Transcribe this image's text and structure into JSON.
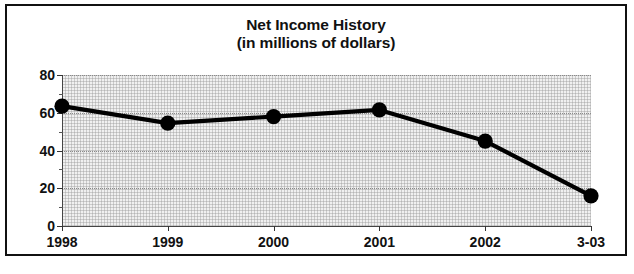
{
  "chart_data": {
    "type": "line",
    "title": "Net Income History",
    "subtitle": "(in millions of dollars)",
    "xlabel": "",
    "ylabel": "",
    "categories": [
      "1998",
      "1999",
      "2000",
      "2001",
      "2002",
      "3-03"
    ],
    "values": [
      63.5,
      54.5,
      58,
      61.5,
      45,
      16
    ],
    "series": [
      {
        "name": "Net Income",
        "values": [
          63.5,
          54.5,
          58,
          61.5,
          45,
          16
        ]
      }
    ],
    "ylim": [
      0,
      80
    ],
    "yticks": [
      0,
      20,
      40,
      60,
      80
    ],
    "ytick_labels": [
      "0",
      "20",
      "40",
      "60",
      "80"
    ],
    "yminor_ticks": [
      10,
      30,
      50,
      70
    ],
    "xtick_labels": [
      "1998",
      "1999",
      "2000",
      "2001",
      "2002",
      "3-03"
    ],
    "grid": true,
    "grid_axis": "y",
    "legend": false,
    "legend_position": "none",
    "marker": "circle",
    "line_color": "#000000",
    "marker_color": "#000000",
    "plot_background": "#f0f0f0",
    "figure_background": "#ffffff",
    "frame_color": "#111111"
  },
  "figure": {
    "title": "Net Income History",
    "subtitle": "(in millions of dollars)"
  }
}
